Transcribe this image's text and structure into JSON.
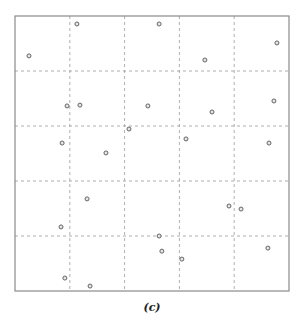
{
  "caption": "(c)",
  "colors": {
    "frame": "#8a8a8a",
    "grid": "#9a9a9a",
    "point_stroke": "#555555",
    "point_fill": "#e6e6e6"
  },
  "chart_data": {
    "type": "scatter",
    "title": "",
    "caption": "(c)",
    "xlabel": "",
    "ylabel": "",
    "xlim": [
      0,
      1
    ],
    "ylim": [
      0,
      1
    ],
    "grid": true,
    "grid_style": "dashed",
    "grid_divisions": 5,
    "x_gridlines": [
      0.2,
      0.4,
      0.6,
      0.8
    ],
    "y_gridlines": [
      0.2,
      0.4,
      0.6,
      0.8
    ],
    "tick_labels": false,
    "legend": null,
    "series": [
      {
        "name": "points",
        "marker": "open-circle",
        "points": [
          [
            0.226,
            0.971
          ],
          [
            0.051,
            0.855
          ],
          [
            0.526,
            0.971
          ],
          [
            0.693,
            0.84
          ],
          [
            0.956,
            0.902
          ],
          [
            0.19,
            0.673
          ],
          [
            0.237,
            0.676
          ],
          [
            0.485,
            0.673
          ],
          [
            0.719,
            0.651
          ],
          [
            0.945,
            0.691
          ],
          [
            0.416,
            0.589
          ],
          [
            0.172,
            0.538
          ],
          [
            0.332,
            0.502
          ],
          [
            0.624,
            0.553
          ],
          [
            0.927,
            0.538
          ],
          [
            0.263,
            0.335
          ],
          [
            0.781,
            0.309
          ],
          [
            0.825,
            0.298
          ],
          [
            0.168,
            0.233
          ],
          [
            0.526,
            0.2
          ],
          [
            0.536,
            0.145
          ],
          [
            0.609,
            0.116
          ],
          [
            0.923,
            0.156
          ],
          [
            0.182,
            0.047
          ],
          [
            0.274,
            0.018
          ]
        ]
      }
    ]
  }
}
